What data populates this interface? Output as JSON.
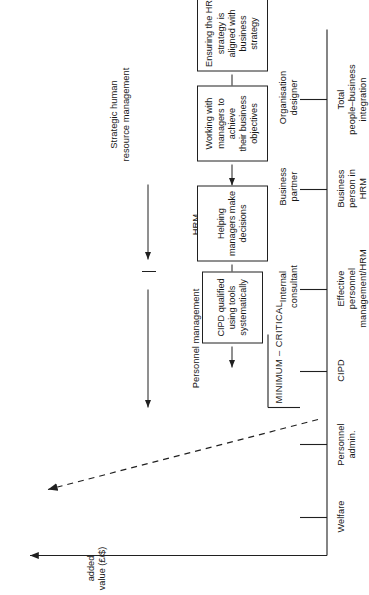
{
  "figure": {
    "kind": "hr-value-evolution-diagram",
    "axis": {
      "y_label": "added\nvalue (£/$)"
    },
    "phases": [
      {
        "id": "personnel-management",
        "label": "Personnel management"
      },
      {
        "id": "hrm",
        "label": "HRM"
      },
      {
        "id": "strategic-hrm",
        "label": "Strategic human\nresource management"
      }
    ],
    "threshold": {
      "label": "MINIMUM – CRITICAL"
    },
    "stages": [
      {
        "id": "welfare",
        "label": "Welfare"
      },
      {
        "id": "personnel-admin",
        "label": "Personnel\nadmin."
      },
      {
        "id": "cipd",
        "label": "CIPD"
      },
      {
        "id": "effective-personnel-management-hrm",
        "label": "Effective\npersonnel\nmanagement/HRM"
      },
      {
        "id": "business-person-in-hrm",
        "label": "Business\nperson in\nHRM"
      },
      {
        "id": "total-people-business-integration",
        "label": "Total\npeople–business\nintegration"
      }
    ],
    "roles": [
      {
        "id": "internal-consultant",
        "label": "Internal\nconsultant"
      },
      {
        "id": "business-partner",
        "label": "Business\npartner"
      },
      {
        "id": "organisation-designer",
        "label": "Organisation\ndesigner"
      }
    ],
    "callouts": [
      {
        "id": "cipd-qualified",
        "label": "CIPD qualified\nusing tools\nsystematically"
      },
      {
        "id": "helping-managers",
        "label": "Helping\nmanagers make\ndecisions"
      },
      {
        "id": "working-with-managers",
        "label": "Working with\nmanagers to\nachieve\ntheir business\nobjectives"
      },
      {
        "id": "ensuring-hr-strategy",
        "label": "Ensuring the HR\nstrategy is\naligned with\nbusiness\nstrategy"
      }
    ],
    "colors": {
      "ink": "#171717",
      "line": "#202020",
      "background": "#ffffff"
    }
  }
}
